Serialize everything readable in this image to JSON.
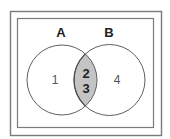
{
  "diagram": {
    "type": "venn",
    "sets": [
      {
        "id": "A",
        "label": "A",
        "cx": 62,
        "cy": 80,
        "r": 35
      },
      {
        "id": "B",
        "label": "B",
        "cx": 109.5,
        "cy": 80,
        "r": 35.5
      }
    ],
    "regions": {
      "a_only": {
        "label": "1",
        "x": 55,
        "y": 84
      },
      "b_only": {
        "label": "4",
        "x": 117,
        "y": 84
      },
      "intersection": {
        "labels": [
          "2",
          "3"
        ],
        "line1": "2",
        "line2": "3",
        "x": 86,
        "y1": 78,
        "y2": 93
      }
    },
    "colors": {
      "background": "#ffffff",
      "frame": "#7a7a7a",
      "circle_stroke": "#606060",
      "intersection_fill": "#c4c4c4",
      "intersection_stroke": "#505050"
    }
  }
}
